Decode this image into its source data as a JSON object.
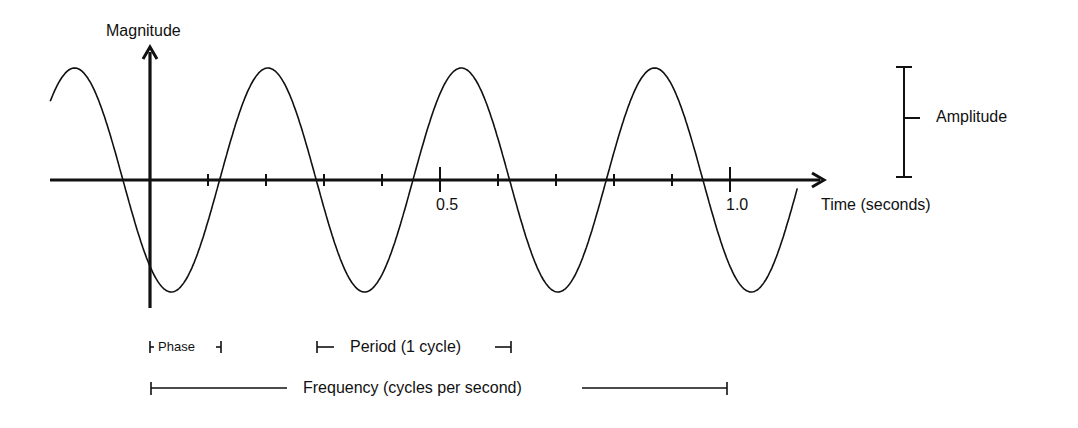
{
  "diagram": {
    "y_axis_label": "Magnitude",
    "x_axis_label": "Time (seconds)",
    "x_tick_labels": [
      {
        "value": 0.5,
        "text": "0.5"
      },
      {
        "value": 1.0,
        "text": "1.0"
      }
    ],
    "annotations": {
      "amplitude": "Amplitude",
      "phase": "Phase",
      "period": "Period (1 cycle)",
      "frequency": "Frequency (cycles per second)"
    },
    "colors": {
      "line": "#111111",
      "background": "#ffffff"
    }
  },
  "chart_data": {
    "type": "line",
    "title": "",
    "xlabel": "Time (seconds)",
    "ylabel": "Magnitude",
    "x_ticks": [
      0.1,
      0.2,
      0.3,
      0.4,
      0.5,
      0.6,
      0.7,
      0.8,
      0.9,
      1.0
    ],
    "x_tick_labels_shown": {
      "0.5": "0.5",
      "1.0": "1.0"
    },
    "xlim": [
      -0.17,
      1.16
    ],
    "ylim": [
      -1,
      1
    ],
    "grid": false,
    "series": [
      {
        "name": "sine wave",
        "function": "A*sin(2*pi*f*t + phi)",
        "amplitude": 1,
        "frequency_hz": 3,
        "period_s": 0.333,
        "phase_offset_s": 0.12
      }
    ],
    "annotations": [
      "Amplitude",
      "Phase",
      "Period (1 cycle)",
      "Frequency (cycles per second)"
    ]
  }
}
